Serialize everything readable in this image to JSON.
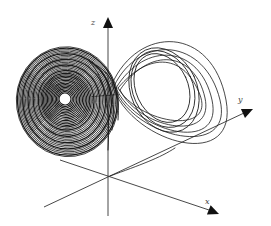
{
  "diagram": {
    "colors": {
      "line": "#1a1a1a",
      "axis": "#333333",
      "background": "#ffffff"
    },
    "origin": [
      108,
      177
    ],
    "axes": [
      {
        "id": "z",
        "label": "z",
        "from": [
          108,
          216
        ],
        "to": [
          108,
          24
        ],
        "arrow_tip": [
          108,
          17
        ],
        "label_pos": [
          91,
          25
        ]
      },
      {
        "id": "y",
        "label": "y",
        "from": [
          44,
          207
        ],
        "to": [
          244,
          113
        ],
        "arrow_tip": [
          253,
          109
        ],
        "label_pos": [
          238,
          102
        ]
      },
      {
        "id": "x",
        "label": "x",
        "from": [
          60,
          160
        ],
        "to": [
          209,
          210
        ],
        "arrow_tip": [
          219,
          214
        ],
        "label_pos": [
          205,
          204
        ]
      }
    ],
    "left_lobe": {
      "center": [
        65,
        99
      ],
      "hole_radius": 6,
      "rings": 34,
      "rx_max": 51,
      "ry_max": 55
    },
    "right_lobe": {
      "center": [
        160,
        84
      ],
      "rings": 7
    }
  }
}
